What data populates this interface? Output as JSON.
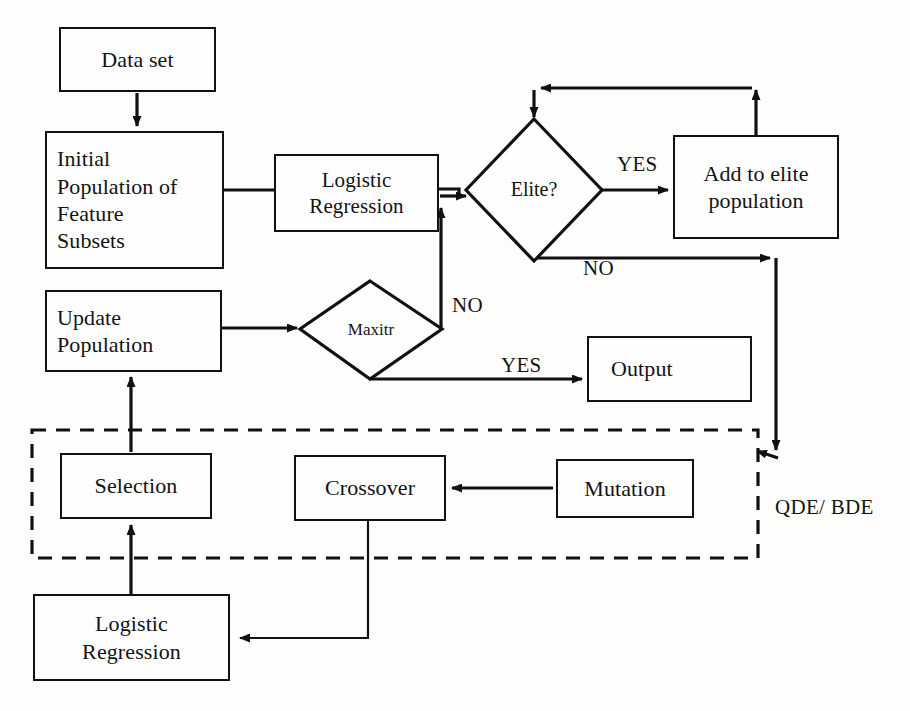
{
  "diagram": {
    "stroke_color": "#111111",
    "background_color": "#fdfdfc",
    "nodes": {
      "data_set": {
        "label": "Data set"
      },
      "initial_population": {
        "label": "Initial\nPopulation of\nFeature\nSubsets"
      },
      "logistic_regression_top": {
        "label": "Logistic\nRegression"
      },
      "elite_decision": {
        "label": "Elite?"
      },
      "add_to_elite": {
        "label": "Add to elite\npopulation"
      },
      "update_population": {
        "label": "Update\nPopulation"
      },
      "maxitr_decision": {
        "label": "Maxitr"
      },
      "output": {
        "label": "Output"
      },
      "selection": {
        "label": "Selection"
      },
      "crossover": {
        "label": "Crossover"
      },
      "mutation": {
        "label": "Mutation"
      },
      "logistic_regression_bottom": {
        "label": "Logistic\nRegression"
      }
    },
    "edge_labels": {
      "elite_yes": "YES",
      "elite_no": "NO",
      "maxitr_no": "NO",
      "maxitr_yes": "YES"
    },
    "group_labels": {
      "qde_bde": "QDE/ BDE"
    }
  }
}
